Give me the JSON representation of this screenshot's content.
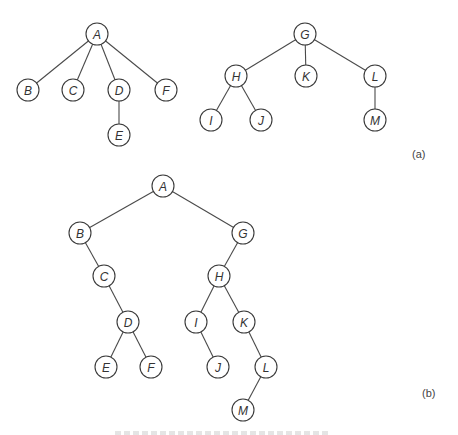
{
  "figure": {
    "parts": [
      {
        "id": "a",
        "label": "(a)",
        "label_pos": [
          412,
          158
        ],
        "description": "Forest of two general trees",
        "trees": [
          {
            "root": "A",
            "nodes": [
              {
                "id": "A",
                "x": 97,
                "y": 34
              },
              {
                "id": "B",
                "x": 28,
                "y": 90
              },
              {
                "id": "C",
                "x": 73,
                "y": 90
              },
              {
                "id": "D",
                "x": 119,
                "y": 90
              },
              {
                "id": "F",
                "x": 166,
                "y": 90
              },
              {
                "id": "E",
                "x": 119,
                "y": 135
              }
            ],
            "edges": [
              [
                "A",
                "B"
              ],
              [
                "A",
                "C"
              ],
              [
                "A",
                "D"
              ],
              [
                "A",
                "F"
              ],
              [
                "D",
                "E"
              ]
            ]
          },
          {
            "root": "G",
            "nodes": [
              {
                "id": "G",
                "x": 305,
                "y": 34
              },
              {
                "id": "H",
                "x": 236,
                "y": 76
              },
              {
                "id": "K",
                "x": 306,
                "y": 76
              },
              {
                "id": "L",
                "x": 375,
                "y": 76
              },
              {
                "id": "I",
                "x": 211,
                "y": 120
              },
              {
                "id": "J",
                "x": 261,
                "y": 120
              },
              {
                "id": "M",
                "x": 375,
                "y": 120
              }
            ],
            "edges": [
              [
                "G",
                "H"
              ],
              [
                "G",
                "K"
              ],
              [
                "G",
                "L"
              ],
              [
                "H",
                "I"
              ],
              [
                "H",
                "J"
              ],
              [
                "L",
                "M"
              ]
            ]
          }
        ]
      },
      {
        "id": "b",
        "label": "(b)",
        "label_pos": [
          422,
          397
        ],
        "description": "Equivalent binary tree",
        "trees": [
          {
            "root": "A",
            "nodes": [
              {
                "id": "A",
                "x": 163,
                "y": 186
              },
              {
                "id": "B",
                "x": 80,
                "y": 233
              },
              {
                "id": "G",
                "x": 243,
                "y": 233
              },
              {
                "id": "C",
                "x": 104,
                "y": 276
              },
              {
                "id": "H",
                "x": 219,
                "y": 276
              },
              {
                "id": "D",
                "x": 128,
                "y": 322
              },
              {
                "id": "I",
                "x": 196,
                "y": 322
              },
              {
                "id": "K",
                "x": 244,
                "y": 322
              },
              {
                "id": "E",
                "x": 106,
                "y": 367
              },
              {
                "id": "F",
                "x": 151,
                "y": 367
              },
              {
                "id": "J",
                "x": 218,
                "y": 367
              },
              {
                "id": "L",
                "x": 266,
                "y": 367
              },
              {
                "id": "M",
                "x": 243,
                "y": 410
              }
            ],
            "edges": [
              [
                "A",
                "B"
              ],
              [
                "A",
                "G"
              ],
              [
                "B",
                "C"
              ],
              [
                "C",
                "D"
              ],
              [
                "D",
                "E"
              ],
              [
                "D",
                "F"
              ],
              [
                "G",
                "H"
              ],
              [
                "H",
                "I"
              ],
              [
                "H",
                "K"
              ],
              [
                "I",
                "J"
              ],
              [
                "K",
                "L"
              ],
              [
                "L",
                "M"
              ]
            ]
          }
        ]
      }
    ],
    "node_radius": 11,
    "colors": {
      "stroke": "#3a3a3a",
      "edge": "#4a4a4a",
      "text": "#333333",
      "background": "#ffffff"
    }
  }
}
